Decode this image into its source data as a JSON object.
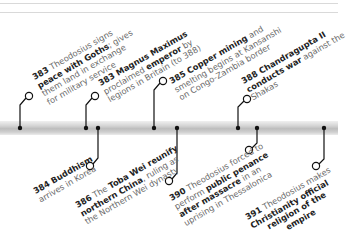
{
  "timeline": {
    "events": [
      {
        "year": "383",
        "lines": [
          [
            "Theodosius signs",
            ""
          ],
          [
            "peace with Goths",
            "; gives"
          ],
          [
            "them land in exchange",
            ""
          ],
          [
            "for military service",
            ""
          ]
        ],
        "pre": "Theodosius signs",
        "bold": "peace with Goths",
        "post": "; gives them land in exchange for military service",
        "side": "above"
      },
      {
        "year": "383",
        "pre": "Magnus Maximus",
        "bold": "",
        "post": "",
        "side": "above"
      },
      {
        "year": "385",
        "pre": "",
        "bold": "Copper mining",
        "post": "",
        "side": "above"
      },
      {
        "year": "388",
        "pre": "",
        "bold": "Chandragupta II",
        "post": "",
        "side": "above"
      },
      {
        "year": "384",
        "pre": "",
        "bold": "Buddhism",
        "post": "",
        "side": "below"
      },
      {
        "year": "386",
        "pre": "The",
        "bold": "Toba Wei reunify",
        "post": "",
        "side": "below"
      },
      {
        "year": "390",
        "pre": "Theodosius forced to",
        "bold": "",
        "post": "",
        "side": "below"
      },
      {
        "year": "391",
        "pre": "Theodosius makes",
        "bold": "",
        "post": "",
        "side": "below"
      }
    ]
  },
  "labels": {
    "e383a": {
      "l1_year": "383",
      "l1_text": " Theodosius signs",
      "l2_bold": "peace with Goths",
      "l2_text": "; gives",
      "l3": "them land in exchange",
      "l4": "for military service"
    },
    "e383b": {
      "l1_year": "383",
      "l1_bold": " Magnus Maximus",
      "l2_text": "proclaimed ",
      "l2_bold": "emperor",
      "l2_text2": " by",
      "l3": "legions in Britain (to 388)"
    },
    "e385": {
      "l1_year": "385",
      "l1_bold": " Copper mining",
      "l1_text": " and",
      "l2": "smelting begins at Kansanshi",
      "l3": "on Congo-Zambia border"
    },
    "e388": {
      "l1_year": "388",
      "l1_bold": " Chandragupta II",
      "l2_bold": "conducts war",
      "l2_text": " against the",
      "l3": "Shakas"
    },
    "e384": {
      "l1_year": "384",
      "l1_bold": " Buddhism",
      "l2": "arrives in Korea"
    },
    "e386": {
      "l1_year": "386",
      "l1_text": " The ",
      "l1_bold": "Toba Wei reunify",
      "l2_bold": "northern China",
      "l2_text": ", ruling as",
      "l3": "the Northern Wei dynasty"
    },
    "e390": {
      "l1_year": "390",
      "l1_text": " Theodosius forced to",
      "l2_text": "perform ",
      "l2_bold": "public penance",
      "l3_bold": "after massacre",
      "l3_text": " in an",
      "l4": "uprising in Thessalonica"
    },
    "e391": {
      "l1_year": "391",
      "l1_text": " Theodosius makes",
      "l2_bold": "Christianity official",
      "l3_bold": "religion of the",
      "l4_bold": "empire"
    }
  }
}
